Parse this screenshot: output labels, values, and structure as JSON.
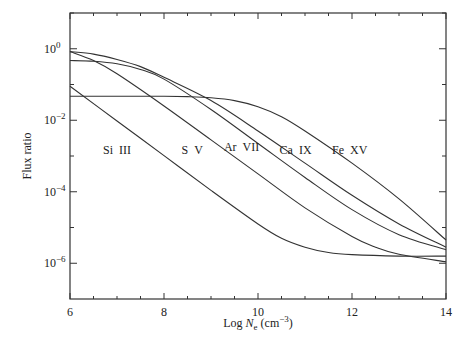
{
  "chart_data": {
    "type": "line",
    "title": "",
    "xlabel": "Log N_e (cm^-3)",
    "xlabel_parts": {
      "prefix": "Log ",
      "var": "N",
      "sub": "e",
      "unit": " (cm",
      "exp": "−3",
      "close": ")"
    },
    "ylabel": "Flux ratio",
    "xlim": [
      6,
      14
    ],
    "ylim_log10": [
      -7,
      1
    ],
    "yscale": "log",
    "grid": false,
    "legend": "inline labels",
    "x_ticks": [
      6,
      8,
      10,
      12,
      14
    ],
    "x_minor_step": 0.5,
    "y_ticks": [
      {
        "exp": 0,
        "label": "0"
      },
      {
        "exp": -2,
        "label": "−2"
      },
      {
        "exp": -4,
        "label": "−4"
      },
      {
        "exp": -6,
        "label": "−6"
      }
    ],
    "y_minor_exps": [
      1,
      -1,
      -3,
      -5
    ],
    "series": [
      {
        "name": "Si III",
        "label_x": 7.0,
        "label_y_log": -2.95,
        "x": [
          6,
          7,
          8,
          9,
          10,
          10.5,
          11,
          11.5,
          12,
          13,
          14
        ],
        "log10_values": [
          -1.05,
          -2.02,
          -2.99,
          -3.96,
          -4.9,
          -5.3,
          -5.55,
          -5.7,
          -5.76,
          -5.8,
          -5.8
        ]
      },
      {
        "name": "S V",
        "label_x": 8.6,
        "label_y_log": -2.95,
        "x": [
          6,
          6.5,
          7,
          8,
          9,
          10,
          11,
          12,
          12.5,
          13,
          14
        ],
        "log10_values": [
          -0.08,
          -0.33,
          -0.7,
          -1.6,
          -2.55,
          -3.5,
          -4.45,
          -5.25,
          -5.55,
          -5.75,
          -5.96
        ]
      },
      {
        "name": "Ar VII",
        "label_x": 9.65,
        "label_y_log": -2.85,
        "x": [
          6,
          6.5,
          7,
          7.5,
          8,
          9,
          10,
          11,
          12,
          13,
          14
        ],
        "log10_values": [
          -0.33,
          -0.35,
          -0.42,
          -0.58,
          -0.85,
          -1.7,
          -2.65,
          -3.6,
          -4.5,
          -5.2,
          -5.62
        ]
      },
      {
        "name": "Ca IX",
        "label_x": 10.8,
        "label_y_log": -2.95,
        "x": [
          6,
          6.5,
          7,
          7.5,
          8,
          9,
          10,
          11,
          12,
          13,
          14
        ],
        "log10_values": [
          -0.08,
          -0.15,
          -0.3,
          -0.5,
          -0.8,
          -1.45,
          -2.3,
          -3.2,
          -4.1,
          -4.9,
          -5.55
        ]
      },
      {
        "name": "Fe XV",
        "label_x": 11.95,
        "label_y_log": -2.95,
        "x": [
          6,
          7,
          8,
          8.5,
          9,
          9.5,
          10,
          10.5,
          11,
          12,
          13,
          14
        ],
        "log10_values": [
          -1.33,
          -1.33,
          -1.33,
          -1.34,
          -1.37,
          -1.45,
          -1.62,
          -1.9,
          -2.3,
          -3.2,
          -4.2,
          -5.35
        ]
      }
    ]
  },
  "colors": {
    "line": "#333333",
    "axis": "#333333",
    "background": "#ffffff"
  }
}
